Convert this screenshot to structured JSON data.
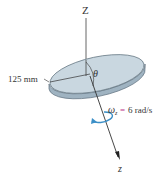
{
  "figure": {
    "axis_top_label": "Z",
    "axis_bottom_label": "z",
    "radius_label": "125 mm",
    "angle_label": "θ",
    "angular_velocity": {
      "symbol": "ω",
      "subscript": "z",
      "equals": "=",
      "value": "6 rad/s"
    },
    "colors": {
      "disc_top": "#c9d7e0",
      "disc_edge": "#9fb3c1",
      "disc_outline": "#5d6f7c",
      "axis": "#444444",
      "rotation_arrow": "#3b8fc7",
      "equals_sign": "#c0388a"
    }
  }
}
